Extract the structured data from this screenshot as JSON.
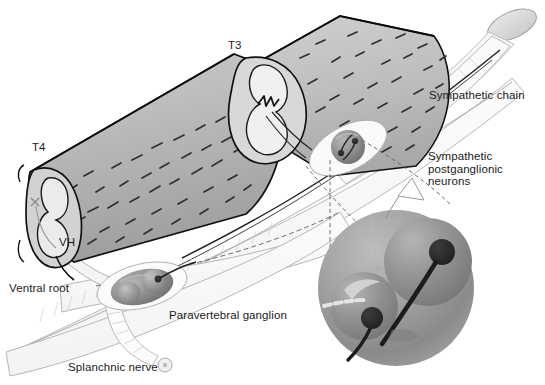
{
  "figure": {
    "background_color": "#ffffff",
    "width": 545,
    "height": 385
  },
  "labels": {
    "t3": "T3",
    "t4": "T4",
    "vh": "VH",
    "ventral_root": "Ventral root",
    "splanchnic_nerve": "Splanchnic nerve",
    "paravertebral_ganglion": "Paravertebral ganglion",
    "sympathetic_chain": "Sympathetic chain",
    "sympathetic_postganglionic_neurons": "Sympathetic\npostganglionic\nneurons"
  },
  "colors": {
    "outline": "#000000",
    "cord_body": "#b4b4b4",
    "cord_body_light": "#c8c8c8",
    "cord_cut_face": "#d2d2d2",
    "cord_gray_matter": "#ececec",
    "cord_dark_wedge": "#4a4a4a",
    "nerve_sheath": "#fbfbfb",
    "nerve_outline": "#b0b0b0",
    "ganglion_fill": "#8c8c8c",
    "ganglion_sphere": "#a8a8a8",
    "neuron_body": "#2b2b2b",
    "inset_circle": "#9a9a9a",
    "inset_sphere": "#8a8a8a",
    "hatch": "#3a3a3a",
    "text": "#1a1a1a",
    "leader_dashed": "#555555"
  },
  "structures": {
    "spinal_cord_segments": [
      "T3",
      "T4"
    ],
    "cut_face_regions": [
      "ventral horn",
      "dorsal horn",
      "gray matter butterfly"
    ],
    "ganglia": [
      {
        "name": "upper-ganglion",
        "neuron_count": 2
      },
      {
        "name": "paravertebral-ganglion",
        "neuron_count": 2
      }
    ],
    "inset": {
      "name": "magnified-neuron-inset",
      "neuron_count": 2,
      "shows": "sympathetic postganglionic neuron cell bodies with axons"
    }
  }
}
